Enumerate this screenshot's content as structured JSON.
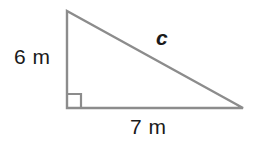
{
  "figure": {
    "kind": "right-triangle-diagram",
    "background_color": "#ffffff",
    "stroke_color": "#8c8c8c",
    "text_color": "#1a1a1a",
    "labels": {
      "vertical_leg": "6 m",
      "horizontal_leg": "7 m",
      "hypotenuse": "c"
    },
    "geometry": {
      "top_vertex": "67,11",
      "right_angle_vertex": "67,108",
      "right_vertex": "243,108",
      "right_angle_marker_size": "14",
      "stroke_width": "2.4"
    }
  }
}
